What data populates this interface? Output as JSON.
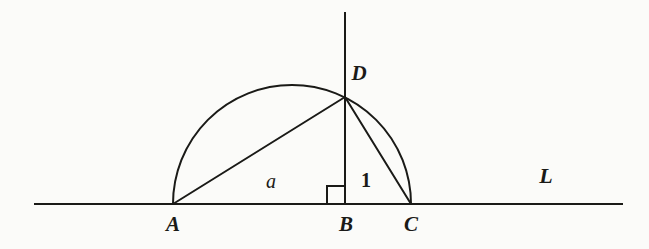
{
  "figure": {
    "background_color": "#fbfbf9",
    "ink_color": "#1a1a17",
    "width": 649,
    "height": 249
  },
  "labels": {
    "vertex_a": "A",
    "vertex_b": "B",
    "vertex_c": "C",
    "vertex_d": "D",
    "segment_ab": "a",
    "segment_bc": "1",
    "line_l": "L"
  },
  "geometry": {
    "baseline": {
      "x1": 35,
      "y": 204,
      "x2": 622
    },
    "vertical_line": {
      "x": 345,
      "y_top": 13,
      "y_bottom": 204
    },
    "semicircle": {
      "cx": 292,
      "cy": 204,
      "r": 119
    },
    "points": {
      "A": {
        "x": 173,
        "y": 204
      },
      "B": {
        "x": 345,
        "y": 204
      },
      "C": {
        "x": 411,
        "y": 204
      },
      "D": {
        "x": 345,
        "y": 97
      }
    },
    "right_angle_marker": {
      "x": 327,
      "y": 186,
      "size": 18
    },
    "label_positions": {
      "A": {
        "x": 173,
        "y": 224
      },
      "B": {
        "x": 346,
        "y": 224
      },
      "C": {
        "x": 411,
        "y": 224
      },
      "D": {
        "x": 359,
        "y": 73
      },
      "a": {
        "x": 271,
        "y": 181
      },
      "one": {
        "x": 366,
        "y": 180
      },
      "L": {
        "x": 546,
        "y": 176
      }
    }
  }
}
